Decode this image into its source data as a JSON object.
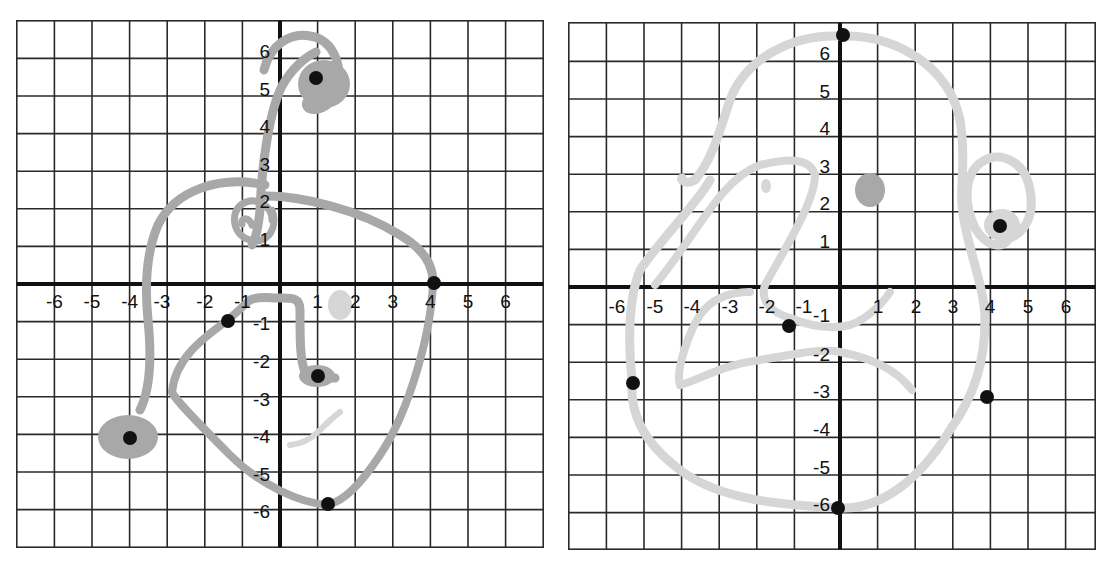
{
  "colors": {
    "grid": "#2a2a2a",
    "axis": "#111111",
    "dark_stroke": "#a8a8a8",
    "light_stroke": "#d6d6d6",
    "dot": "#111111",
    "label": "#111111"
  },
  "axis_labels": {
    "x": [
      "-6",
      "-5",
      "-4",
      "-3",
      "-2",
      "-1",
      "1",
      "2",
      "3",
      "4",
      "5",
      "6"
    ],
    "y": [
      "6",
      "5",
      "4",
      "3",
      "2",
      "1",
      "-1",
      "-2",
      "-3",
      "-4",
      "-5",
      "-6"
    ]
  },
  "panels": [
    {
      "id": "left-graph",
      "origin_px": [
        280,
        284
      ],
      "cell_px": 37.6,
      "grid_range": [
        -7,
        7
      ],
      "dots": [
        {
          "x": 1.0,
          "y": 5.5
        },
        {
          "x": 4.1,
          "y": 0.0
        },
        {
          "x": -1.4,
          "y": -1.0
        },
        {
          "x": 1.1,
          "y": -2.5
        },
        {
          "x": -4.0,
          "y": -4.2
        },
        {
          "x": 1.3,
          "y": -5.9
        }
      ],
      "blobs": [
        {
          "x": 1.6,
          "y": -0.6,
          "r": 0.35,
          "tone": "light"
        },
        {
          "x": -4.1,
          "y": -4.1,
          "r": 0.5,
          "tone": "dark"
        },
        {
          "x": 1.2,
          "y": 5.2,
          "r": 0.65,
          "tone": "dark"
        }
      ]
    },
    {
      "id": "right-graph",
      "origin_px": [
        840,
        287
      ],
      "cell_px": 37.6,
      "grid_range": [
        -7,
        7
      ],
      "dots": [
        {
          "x": 0.0,
          "y": 6.6
        },
        {
          "x": 4.4,
          "y": 1.5
        },
        {
          "x": -1.4,
          "y": -1.1
        },
        {
          "x": -5.6,
          "y": -2.7
        },
        {
          "x": 4.0,
          "y": -3.0
        },
        {
          "x": 0.0,
          "y": -5.9
        }
      ],
      "blobs": [
        {
          "x": 0.8,
          "y": 2.5,
          "r": 0.42,
          "tone": "dark"
        },
        {
          "x": -1.8,
          "y": 2.6,
          "r": 0.17,
          "tone": "light"
        }
      ]
    }
  ]
}
